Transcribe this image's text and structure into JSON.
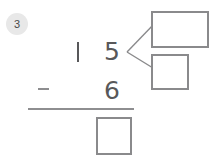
{
  "worksheet": {
    "step_badge": "3",
    "type": "vertical-subtraction",
    "problem": {
      "minuend_tens": "1",
      "minuend_ones": "5",
      "subtrahend_ones": "6",
      "operator": "−",
      "answer": ""
    },
    "boxes": {
      "answer_box": "",
      "callout_top_box": "",
      "callout_bottom_box": ""
    },
    "colors": {
      "ink": "#58585a",
      "stroke": "#8a8a8c",
      "badge_bg": "#e8e8e8",
      "badge_text": "#4a4a4a",
      "page_bg": "#ffffff"
    }
  }
}
